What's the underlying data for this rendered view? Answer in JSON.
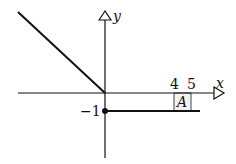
{
  "diagram": {
    "type": "piecewise-function-graph",
    "axes": {
      "x_label": "x",
      "y_label": "y"
    },
    "tick_labels": {
      "x4": "4",
      "x5": "5",
      "y_minus1": "−1"
    },
    "region_label": "A",
    "segments": [
      {
        "name": "diagonal-line",
        "description": "y = -x for x <= 0"
      },
      {
        "name": "constant-line",
        "description": "y = -1 for x >= 0",
        "start_point": "filled dot at (0,-1)"
      }
    ],
    "colors": {
      "stroke": "#111111",
      "box_fill": "#f2f2f2"
    }
  }
}
